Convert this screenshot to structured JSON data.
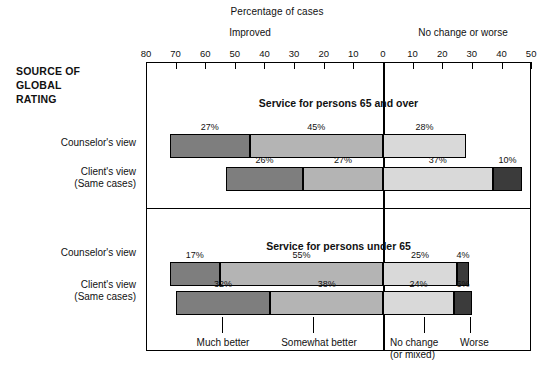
{
  "titles": {
    "supertitle": "Percentage of cases",
    "group_left": "Improved",
    "group_right": "No change or  worse",
    "source_line1": "SOURCE OF",
    "source_line2": "GLOBAL",
    "source_line3": "RATING"
  },
  "axis": {
    "tick_labels": [
      "80",
      "70",
      "60",
      "50",
      "40",
      "30",
      "20",
      "10",
      "0",
      "10",
      "20",
      "30",
      "40",
      "50"
    ],
    "zero_label": "0"
  },
  "panels": [
    {
      "title": "Service for persons 65 and over",
      "rows": [
        {
          "label_line1": "Counselor's view",
          "label_line2": "",
          "values": [
            27,
            45,
            28,
            0
          ],
          "value_labels": [
            "27%",
            "45%",
            "28%",
            ""
          ]
        },
        {
          "label_line1": "Client's view",
          "label_line2": "(Same cases)",
          "values": [
            26,
            27,
            37,
            10
          ],
          "value_labels": [
            "26%",
            "27%",
            "37%",
            "10%"
          ]
        }
      ]
    },
    {
      "title": "Service for persons under 65",
      "rows": [
        {
          "label_line1": "Counselor's view",
          "label_line2": "",
          "values": [
            17,
            55,
            25,
            4
          ],
          "value_labels": [
            "17%",
            "55%",
            "25%",
            "4%"
          ]
        },
        {
          "label_line1": "Client's view",
          "label_line2": "(Same cases)",
          "values": [
            32,
            38,
            24,
            6
          ],
          "value_labels": [
            "32%",
            "38%",
            "24%",
            "6%"
          ]
        }
      ]
    }
  ],
  "legend": {
    "items": [
      {
        "label_line1": "Much better",
        "label_line2": ""
      },
      {
        "label_line1": "Somewhat better",
        "label_line2": ""
      },
      {
        "label_line1": "No change",
        "label_line2": "(or mixed)"
      },
      {
        "label_line1": "Worse",
        "label_line2": ""
      }
    ]
  },
  "colors": {
    "much_better": "#7e7e7e",
    "somewhat_better": "#b4b4b4",
    "no_change": "#d9d9d9",
    "worse": "#3b3b3b",
    "ink": "#111111",
    "background": "#ffffff"
  },
  "chart_data": {
    "type": "bar",
    "title": "Percentage of cases",
    "subtitle": "SOURCE OF GLOBAL RATING",
    "orientation": "horizontal",
    "stacked": true,
    "diverging": true,
    "xlabel": "Percentage of cases",
    "ylabel": "",
    "xlim": [
      -80,
      50
    ],
    "zero_at": 0,
    "grid": false,
    "legend_position": "bottom",
    "xticks": [
      -80,
      -70,
      -60,
      -50,
      -40,
      -30,
      -20,
      -10,
      0,
      10,
      20,
      30,
      40,
      50
    ],
    "xticklabels": [
      "80",
      "70",
      "60",
      "50",
      "40",
      "30",
      "20",
      "10",
      "0",
      "10",
      "20",
      "30",
      "40",
      "50"
    ],
    "group_annotations": [
      "Improved",
      "No change or  worse"
    ],
    "series": [
      {
        "name": "Much better",
        "color": "#7e7e7e",
        "side": "left",
        "values": [
          27,
          26,
          17,
          32
        ]
      },
      {
        "name": "Somewhat better",
        "color": "#b4b4b4",
        "side": "left",
        "values": [
          45,
          27,
          55,
          38
        ]
      },
      {
        "name": "No change (or mixed)",
        "color": "#d9d9d9",
        "side": "right",
        "values": [
          28,
          37,
          25,
          24
        ]
      },
      {
        "name": "Worse",
        "color": "#3b3b3b",
        "side": "right",
        "values": [
          0,
          10,
          4,
          6
        ]
      }
    ],
    "categories": [
      "65 and over — Counselor's view",
      "65 and over — Client's view (Same cases)",
      "under 65 — Counselor's view",
      "under 65 — Client's view (Same cases)"
    ],
    "panels": [
      {
        "title": "Service for persons 65 and over",
        "rows": [
          {
            "name": "Counselor's view",
            "Much better": 27,
            "Somewhat better": 45,
            "No change (or mixed)": 28,
            "Worse": 0
          },
          {
            "name": "Client's view (Same cases)",
            "Much better": 26,
            "Somewhat better": 27,
            "No change (or mixed)": 37,
            "Worse": 10
          }
        ]
      },
      {
        "title": "Service for persons under 65",
        "rows": [
          {
            "name": "Counselor's view",
            "Much better": 17,
            "Somewhat better": 55,
            "No change (or mixed)": 25,
            "Worse": 4
          },
          {
            "name": "Client's view (Same cases)",
            "Much better": 32,
            "Somewhat better": 38,
            "No change (or mixed)": 24,
            "Worse": 6
          }
        ]
      }
    ]
  }
}
